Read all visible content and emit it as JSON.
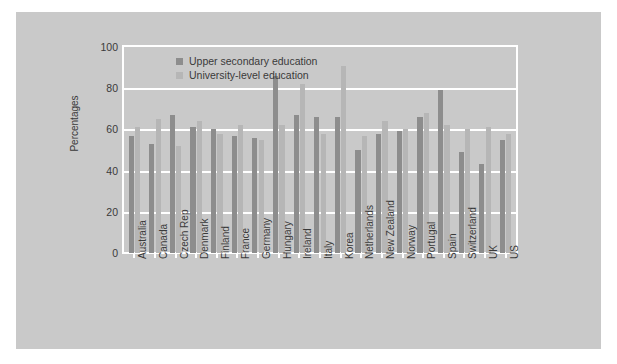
{
  "chart_data": {
    "type": "bar",
    "title": "",
    "xlabel": "",
    "ylabel": "Percentages",
    "ylim": [
      0,
      100
    ],
    "yticks": [
      0,
      20,
      40,
      60,
      80,
      100
    ],
    "grid": true,
    "legend_position": "top-left-inside",
    "categories": [
      "Australia",
      "Canada",
      "Czech Rep",
      "Denmark",
      "Finland",
      "France",
      "Germany",
      "Hungary",
      "Ireland",
      "Italy",
      "Korea",
      "Netherlands",
      "New Zealand",
      "Norway",
      "Portugal",
      "Spain",
      "Switzerland",
      "UK",
      "US"
    ],
    "series": [
      {
        "name": "Upper secondary education",
        "color": "#8d8d8d",
        "values": [
          57,
          53,
          67,
          61,
          60,
          57,
          56,
          86,
          67,
          66,
          66,
          50,
          58,
          59,
          66,
          79,
          49,
          43,
          55
        ]
      },
      {
        "name": "University-level education",
        "color": "#b6b6b6",
        "values": [
          61,
          65,
          52,
          64,
          58,
          62,
          55,
          62,
          82,
          58,
          91,
          57,
          64,
          60,
          68,
          62,
          60,
          61,
          58
        ]
      }
    ]
  },
  "legend": {
    "items": [
      {
        "label": "Upper secondary education",
        "swatch": "dark"
      },
      {
        "label": "University-level education",
        "swatch": "light"
      }
    ]
  },
  "axes": {
    "y_title": "Percentages",
    "y_ticks": [
      "100",
      "80",
      "60",
      "40",
      "20",
      "0"
    ]
  }
}
